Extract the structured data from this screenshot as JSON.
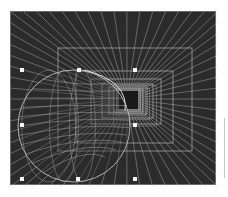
{
  "canvas": {
    "background": "#2b2b2b",
    "line_color": "#bdbdbd",
    "vanishing_point": [
      116,
      87
    ],
    "tunnel_rects": [
      [
        47,
        36,
        181,
        139
      ],
      [
        65,
        59,
        162,
        131
      ],
      [
        80,
        67,
        150,
        112
      ],
      [
        91,
        72,
        142,
        106
      ],
      [
        98,
        75,
        136,
        102
      ],
      [
        103,
        77,
        132,
        100
      ],
      [
        106,
        78,
        129,
        98
      ]
    ],
    "inner_void": [
      108,
      79,
      127,
      97
    ],
    "sphere": {
      "cx": 63,
      "cy": 114,
      "r": 56
    }
  },
  "selection_handles": [
    [
      9,
      56
    ],
    [
      66,
      56
    ],
    [
      122,
      56
    ],
    [
      9,
      111
    ],
    [
      122,
      111
    ],
    [
      9,
      165
    ],
    [
      65,
      165
    ],
    [
      122,
      165
    ]
  ]
}
